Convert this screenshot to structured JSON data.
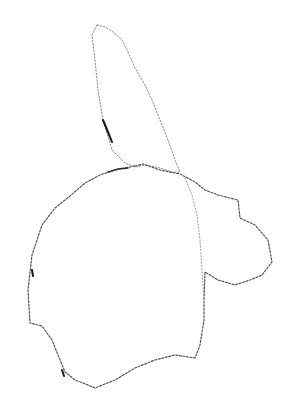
{
  "image": {
    "width": 292,
    "height": 414,
    "background": "#ffffff",
    "stroke_color": "#6b6b6b",
    "accent_stroke_color": "#1a1a1a",
    "description": "Sparse dotted line sketch: tall narrow leaf/ear shape above a large rounded body shape with a smaller lobe on the right"
  },
  "shapes": {
    "upper_lobe": {
      "points": "97,25 92,35 95,60 98,90 103,120 112,150 125,163 135,167 145,165 160,168 172,172 180,172 175,160 168,140 160,120 152,100 145,85 135,68 128,52 122,40 113,32 105,27 97,25"
    },
    "main_body": {
      "points": "135,166 143,164 160,170 180,174 195,182 205,190 218,195 238,200 240,218 255,225 268,240 272,262 262,275 250,280 235,285 218,280 205,272 204,300 204,320 200,345 195,358 175,355 155,360 135,368 115,380 95,388 88,385 75,380 65,372 58,355 52,340 42,326 30,323 28,290 32,255 42,225 55,208 70,196 85,183 100,175 115,170 135,166"
    },
    "inner_line": {
      "points": "185,178 192,195 197,215 200,240 202,270 204,300"
    },
    "dark_marks": [
      {
        "points": "103,120 108,132 112,142"
      },
      {
        "points": "108,172 118,169 128,168"
      },
      {
        "points": "32,270 33,276"
      },
      {
        "points": "62,370 64,376"
      }
    ]
  }
}
